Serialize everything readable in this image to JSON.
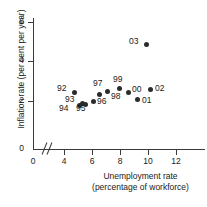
{
  "chart_data": {
    "type": "scatter",
    "title": "",
    "xlabel": "Unemployment rate (percentage of workforce)",
    "ylabel": "Inflation rate (per cent per year)",
    "xlabel_lines": [
      "Unemployment rate",
      "(percentage of workforce)"
    ],
    "xlim": [
      3.4,
      13.2
    ],
    "ylim": [
      0,
      6.4
    ],
    "x_ticks": [
      0,
      4,
      6,
      8,
      10,
      12
    ],
    "x_tick_labels": [
      "0",
      "4",
      "6",
      "8",
      "10",
      "12"
    ],
    "y_ticks": [
      0,
      2,
      4,
      6
    ],
    "y_tick_labels": [
      "0",
      "2",
      "4",
      "6"
    ],
    "x_axis_break": true,
    "grid": false,
    "legend": false,
    "marker_color": "#2b2b2b",
    "axis_color": "#3a3a3a",
    "background": "#ffffff",
    "points": [
      {
        "label": "92",
        "x": 10.0,
        "y": 2.85,
        "label_pos": "left"
      },
      {
        "label": "93",
        "x": 10.4,
        "y": 2.3,
        "label_pos": "left"
      },
      {
        "label": "94",
        "x": 9.5,
        "y": 2.15,
        "label_pos": "below-left"
      },
      {
        "label": "95",
        "x": 8.6,
        "y": 2.15,
        "label_pos": "below"
      },
      {
        "label": "96",
        "x": 8.0,
        "y": 2.3,
        "label_pos": "right"
      },
      {
        "label": "97",
        "x": 7.0,
        "y": 2.65,
        "label_pos": "above"
      },
      {
        "label": "98",
        "x": 6.2,
        "y": 2.8,
        "label_pos": "below-right"
      },
      {
        "label": "99",
        "x": 6.0,
        "y": 3.0,
        "label_pos": "above"
      },
      {
        "label": "00",
        "x": 5.5,
        "y": 2.8,
        "label_pos": "right"
      },
      {
        "label": "01",
        "x": 5.1,
        "y": 2.4,
        "label_pos": "right"
      },
      {
        "label": "02",
        "x": 5.2,
        "y": 2.95,
        "label_pos": "right"
      },
      {
        "label": "03",
        "x": 5.0,
        "y": 4.7,
        "label_pos": "left"
      }
    ],
    "pixel_points": [
      {
        "label": "92",
        "px": 74,
        "py": 92,
        "lx": 57,
        "ly": 88
      },
      {
        "label": "93",
        "px": 82,
        "py": 103,
        "lx": 65,
        "ly": 99
      },
      {
        "label": "94",
        "px": 79,
        "py": 105,
        "lx": 59,
        "ly": 108
      },
      {
        "label": "95",
        "px": 85,
        "py": 104,
        "lx": 76,
        "ly": 108
      },
      {
        "label": "96",
        "px": 93,
        "py": 101,
        "lx": 97,
        "ly": 101
      },
      {
        "label": "97",
        "px": 99,
        "py": 94,
        "lx": 93,
        "ly": 83
      },
      {
        "label": "98",
        "px": 107,
        "py": 91,
        "lx": 111,
        "ly": 96
      },
      {
        "label": "99",
        "px": 119,
        "py": 88,
        "lx": 113,
        "ly": 79
      },
      {
        "label": "00",
        "px": 128,
        "py": 92,
        "lx": 132,
        "ly": 89
      },
      {
        "label": "01",
        "px": 137,
        "py": 99,
        "lx": 142,
        "ly": 100
      },
      {
        "label": "02",
        "px": 150,
        "py": 89,
        "lx": 155,
        "ly": 88
      },
      {
        "label": "03",
        "px": 146,
        "py": 44,
        "lx": 129,
        "ly": 41
      }
    ],
    "pixel_x_ticks": [
      {
        "value": "0",
        "px": 33
      },
      {
        "value": "4",
        "px": 64
      },
      {
        "value": "6",
        "px": 92
      },
      {
        "value": "8",
        "px": 120
      },
      {
        "value": "10",
        "px": 148
      },
      {
        "value": "12",
        "px": 176
      }
    ],
    "pixel_y_ticks": [
      {
        "value": "0",
        "py": 149
      },
      {
        "value": "2",
        "py": 101
      },
      {
        "value": "4",
        "py": 61
      },
      {
        "value": "6",
        "py": 22
      }
    ]
  }
}
